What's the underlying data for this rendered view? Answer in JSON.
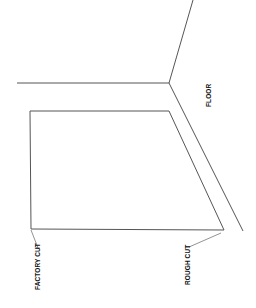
{
  "diagram": {
    "type": "installation-detail",
    "labels": {
      "floor": "FLOOR",
      "factory_cut": "FACTORY CUT",
      "rough_cut": "ROUGH CUT"
    },
    "colors": {
      "line": "#555555",
      "text": "#111111",
      "background": "#ffffff"
    }
  }
}
